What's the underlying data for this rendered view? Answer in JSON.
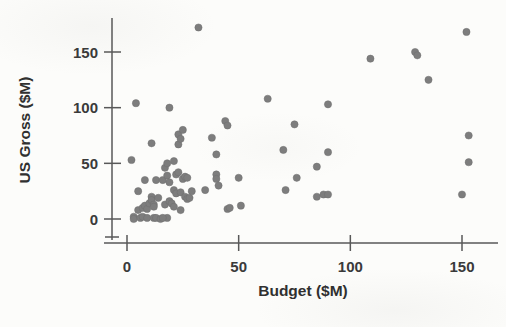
{
  "chart_data": {
    "type": "scatter",
    "title": "",
    "xlabel": "Budget ($M)",
    "ylabel": "US Gross ($M)",
    "xlim": [
      -6,
      162
    ],
    "ylim": [
      -14,
      182
    ],
    "xticks": [
      0,
      50,
      100,
      150
    ],
    "yticks": [
      0,
      50,
      100,
      150
    ],
    "xticklabels": [
      "0",
      "50",
      "100",
      "150"
    ],
    "yticklabels": [
      "0",
      "50",
      "100",
      "150"
    ],
    "grid": false,
    "legend": null,
    "marker": {
      "shape": "circle",
      "color": "#7d7d7d",
      "size_px": 7.2,
      "count": 86
    },
    "points": [
      [
        2,
        53
      ],
      [
        3,
        2
      ],
      [
        3,
        0
      ],
      [
        4,
        104
      ],
      [
        5,
        25
      ],
      [
        5,
        8
      ],
      [
        6,
        1
      ],
      [
        7,
        10
      ],
      [
        7,
        2
      ],
      [
        8,
        35
      ],
      [
        8,
        12
      ],
      [
        9,
        9
      ],
      [
        9,
        1
      ],
      [
        10,
        14
      ],
      [
        11,
        68
      ],
      [
        11,
        20
      ],
      [
        11,
        17
      ],
      [
        12,
        13
      ],
      [
        12,
        1
      ],
      [
        13,
        35
      ],
      [
        13,
        1
      ],
      [
        14,
        19
      ],
      [
        15,
        0
      ],
      [
        16,
        35
      ],
      [
        17,
        46
      ],
      [
        17,
        13
      ],
      [
        18,
        50
      ],
      [
        18,
        39
      ],
      [
        18,
        1
      ],
      [
        19,
        100
      ],
      [
        19,
        33
      ],
      [
        19,
        16
      ],
      [
        20,
        14
      ],
      [
        21,
        52
      ],
      [
        21,
        26
      ],
      [
        22,
        40
      ],
      [
        22,
        23
      ],
      [
        23,
        76
      ],
      [
        23,
        67
      ],
      [
        23,
        42
      ],
      [
        24,
        72
      ],
      [
        24,
        24
      ],
      [
        24,
        8
      ],
      [
        25,
        80
      ],
      [
        25,
        36
      ],
      [
        26,
        38
      ],
      [
        26,
        20
      ],
      [
        27,
        18
      ],
      [
        28,
        19
      ],
      [
        29,
        25
      ],
      [
        32,
        172
      ],
      [
        38,
        73
      ],
      [
        40,
        58
      ],
      [
        40,
        40
      ],
      [
        40,
        36
      ],
      [
        41,
        30
      ],
      [
        44,
        88
      ],
      [
        45,
        84
      ],
      [
        45,
        9
      ],
      [
        50,
        37
      ],
      [
        51,
        12
      ],
      [
        63,
        108
      ],
      [
        70,
        62
      ],
      [
        71,
        26
      ],
      [
        75,
        85
      ],
      [
        76,
        37
      ],
      [
        85,
        47
      ],
      [
        85,
        20
      ],
      [
        88,
        22
      ],
      [
        90,
        103
      ],
      [
        90,
        60
      ],
      [
        90,
        22
      ],
      [
        109,
        144
      ],
      [
        129,
        150
      ],
      [
        130,
        147
      ],
      [
        135,
        125
      ],
      [
        150,
        22
      ],
      [
        152,
        168
      ],
      [
        153,
        75
      ],
      [
        153,
        51
      ],
      [
        12,
        11
      ],
      [
        16,
        1
      ],
      [
        21,
        11
      ],
      [
        27,
        37
      ],
      [
        35,
        26
      ],
      [
        46,
        10
      ]
    ]
  },
  "axes": {
    "x_axis_name": "x-axis",
    "y_axis_name": "y-axis"
  }
}
